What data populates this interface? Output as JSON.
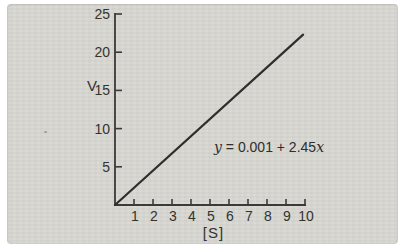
{
  "figure": {
    "paper_color": "#d8d7d2",
    "axis_color": "#3a3a38",
    "line_color": "#2e2e2c",
    "text_color": "#333330",
    "y_axis_label": "V",
    "x_axis_label": "[S]",
    "equation": {
      "full": "y = 0.001 + 2.45x",
      "lhs_var": "y",
      "middle": " = 0.001 + 2.45",
      "rhs_var": "x"
    }
  },
  "chart_data": {
    "type": "line",
    "title": "",
    "xlabel": "[S]",
    "ylabel": "V",
    "xlim": [
      0,
      10
    ],
    "ylim": [
      0,
      25
    ],
    "x_ticks": [
      1,
      2,
      3,
      4,
      5,
      6,
      7,
      8,
      9,
      10
    ],
    "y_ticks": [
      5,
      10,
      15,
      20,
      25
    ],
    "grid": false,
    "legend": false,
    "series": [
      {
        "name": "fitted-line",
        "x": [
          0,
          9.9
        ],
        "y": [
          0,
          22.3
        ]
      }
    ],
    "annotation": "y = 0.001 + 2.45x",
    "fit": {
      "intercept": 0.001,
      "slope": 2.45
    }
  }
}
